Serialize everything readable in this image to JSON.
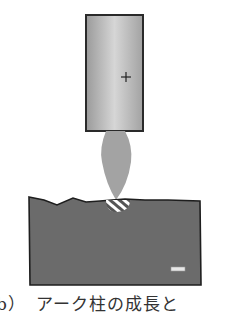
{
  "figure": {
    "caption": "b）　アーク柱の成長と",
    "elements": {
      "electrode": {
        "label": "electrode",
        "symbol": "+",
        "fill": "#b8b8b8",
        "stroke": "#2a2a2a"
      },
      "arc": {
        "label": "arc-column",
        "fill": "#a0a0a0"
      },
      "workpiece": {
        "label": "workpiece",
        "symbol": "−",
        "fill": "#6e6e6e",
        "stroke": "#222222"
      },
      "melt_zone": {
        "label": "molten-pool",
        "pattern": "striped"
      }
    }
  }
}
